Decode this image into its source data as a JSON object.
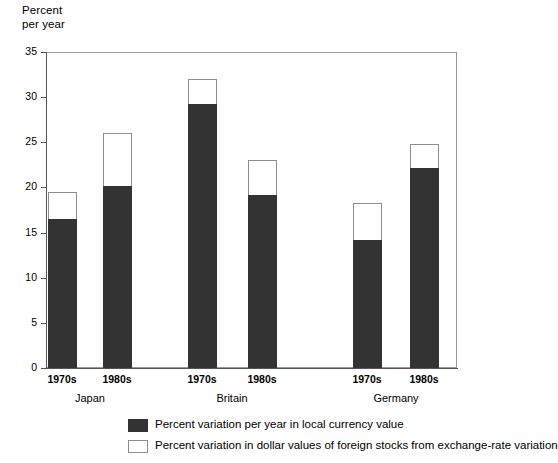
{
  "chart_data": {
    "type": "bar",
    "stacked": true,
    "title": "",
    "ylabel": "Percent\nper year",
    "xlabel": "",
    "ylim": [
      0,
      35
    ],
    "yticks": [
      0,
      5,
      10,
      15,
      20,
      25,
      30,
      35
    ],
    "ytick_labels": [
      "0",
      "5",
      "10",
      "15",
      "20",
      "25",
      "30",
      "35"
    ],
    "grid": false,
    "legend_position": "bottom",
    "groups": [
      "Japan",
      "Britain",
      "Germany"
    ],
    "categories": [
      "1970s",
      "1980s",
      "1970s",
      "1980s",
      "1970s",
      "1980s"
    ],
    "series": [
      {
        "name": "Percent variation per year in local currency value",
        "color": "#333333",
        "values": [
          16.5,
          20.2,
          29.2,
          19.2,
          14.2,
          22.2
        ]
      },
      {
        "name": "Percent variation in dollar values of foreign stocks from exchange-rate variation",
        "color": "#ffffff",
        "values": [
          3.0,
          5.8,
          2.8,
          3.8,
          4.1,
          2.6
        ]
      }
    ],
    "totals": [
      19.5,
      26.0,
      32.0,
      23.0,
      18.3,
      24.8
    ],
    "bars": [
      {
        "group": "Japan",
        "period": "1970s",
        "local": 16.5,
        "total": 19.5
      },
      {
        "group": "Japan",
        "period": "1980s",
        "local": 20.2,
        "total": 26.0
      },
      {
        "group": "Britain",
        "period": "1970s",
        "local": 29.2,
        "total": 32.0
      },
      {
        "group": "Britain",
        "period": "1980s",
        "local": 19.2,
        "total": 23.0
      },
      {
        "group": "Germany",
        "period": "1970s",
        "local": 14.2,
        "total": 18.3
      },
      {
        "group": "Germany",
        "period": "1980s",
        "local": 22.2,
        "total": 24.8
      }
    ]
  },
  "axis": {
    "y_title": "Percent\nper year",
    "ticks": [
      "35",
      "30",
      "25",
      "20",
      "15",
      "10",
      "5",
      "0"
    ]
  },
  "x_labels": [
    {
      "label": "1970s"
    },
    {
      "label": "1980s"
    },
    {
      "label": "1970s"
    },
    {
      "label": "1980s"
    },
    {
      "label": "1970s"
    },
    {
      "label": "1980s"
    }
  ],
  "group_labels": [
    {
      "label": "Japan"
    },
    {
      "label": "Britain"
    },
    {
      "label": "Germany"
    }
  ],
  "legend": {
    "items": [
      {
        "label": "Percent variation per year in local currency value",
        "style": "filled",
        "color": "#333333"
      },
      {
        "label": "Percent variation in dollar values of foreign stocks from exchange-rate variation",
        "style": "hollow",
        "color": "#ffffff"
      }
    ]
  }
}
